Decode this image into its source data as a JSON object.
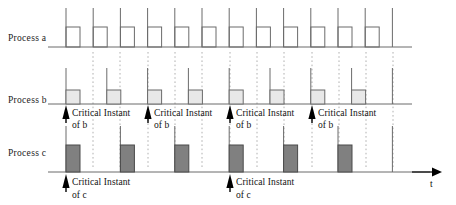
{
  "figure": {
    "time_axis_label": "t",
    "background_color": "#ffffff"
  },
  "rows": [
    {
      "id": "process-a",
      "label": "Process a",
      "label_x": 8,
      "label_y": 41,
      "baseline_y": 47,
      "baseline_x_start": 48,
      "baseline_x_end": 412,
      "pulse_fill": "none",
      "pulse_stroke": "#6b6b6b",
      "pulse_top_y": 27,
      "tick_top_y": 8,
      "start_x": 66,
      "period_px": 27.2,
      "width_px": 14,
      "count": 13,
      "pulse_count": 12
    },
    {
      "id": "process-b",
      "label": "Process b",
      "label_x": 8,
      "label_y": 103,
      "baseline_y": 104,
      "baseline_x_start": 48,
      "baseline_x_end": 412,
      "pulse_fill": "#e8e8e8",
      "pulse_stroke": "#6b6b6b",
      "pulse_top_y": 90,
      "tick_top_y": 68,
      "start_x": 66,
      "period_px": 40.8,
      "width_px": 14,
      "count": 9,
      "pulse_count": 8
    },
    {
      "id": "process-c",
      "label": "Process c",
      "label_x": 8,
      "label_y": 156,
      "baseline_y": 172,
      "baseline_x_start": 48,
      "baseline_x_end": 430,
      "pulse_fill": "#808080",
      "pulse_stroke": "#4a4a4a",
      "pulse_top_y": 145,
      "tick_top_y": 126,
      "start_x": 66,
      "period_px": 54.4,
      "width_px": 14,
      "count": 7,
      "pulse_count": 6
    }
  ],
  "dotted_guides": {
    "color": "#b0b0b0",
    "top_y": 52,
    "bottom_y": 168,
    "x_positions": [
      93,
      120,
      148,
      175,
      202,
      230,
      257,
      284,
      312,
      339,
      366,
      393
    ]
  },
  "annotations_b": [
    {
      "id": "critical-instant-b-1",
      "arrow_x": 66,
      "text_x": 72,
      "line1": "Critical Instant",
      "line2": "of b",
      "line1_y": 116,
      "line2_y": 128
    },
    {
      "id": "critical-instant-b-2",
      "arrow_x": 148,
      "text_x": 154,
      "line1": "Critical Instant",
      "line2": "of b",
      "line1_y": 116,
      "line2_y": 128
    },
    {
      "id": "critical-instant-b-3",
      "arrow_x": 230,
      "text_x": 236,
      "line1": "Critical Instant",
      "line2": "of b",
      "line1_y": 116,
      "line2_y": 128
    },
    {
      "id": "critical-instant-b-4",
      "arrow_x": 312,
      "text_x": 318,
      "line1": "Critical Instant",
      "line2": "of b",
      "line1_y": 116,
      "line2_y": 128
    }
  ],
  "annotations_c": [
    {
      "id": "critical-instant-c-1",
      "arrow_x": 66,
      "text_x": 72,
      "line1": "Critical Instant",
      "line2": "of c",
      "line1_y": 185,
      "line2_y": 198
    },
    {
      "id": "critical-instant-c-2",
      "arrow_x": 230,
      "text_x": 236,
      "line1": "Critical Instant",
      "line2": "of c",
      "line1_y": 185,
      "line2_y": 198
    }
  ],
  "time_arrow": {
    "x_start": 412,
    "x_end": 442,
    "y": 172,
    "label": "t",
    "label_x": 430,
    "label_y": 187
  },
  "colors": {
    "stroke_light": "#6b6b6b",
    "stroke_dark": "#4a4a4a",
    "fill_b": "#e8e8e8",
    "fill_c": "#808080",
    "dotted": "#b0b0b0",
    "text": "#111111",
    "arrow": "#000000"
  },
  "chart_data": {
    "type": "line",
    "xlabel": "t",
    "ylabel": "",
    "grid": false,
    "legend": "none",
    "series": [
      {
        "name": "Process a",
        "period": 1,
        "execution": 0.5,
        "pulse_count": 12,
        "fill": "none",
        "release_times": [
          0,
          1,
          2,
          3,
          4,
          5,
          6,
          7,
          8,
          9,
          10,
          11
        ]
      },
      {
        "name": "Process b",
        "period": 1.5,
        "execution": 0.5,
        "pulse_count": 8,
        "fill": "#e8e8e8",
        "release_times": [
          0,
          1.5,
          3,
          4.5,
          6,
          7.5,
          9,
          10.5
        ]
      },
      {
        "name": "Process c",
        "period": 2,
        "execution": 0.5,
        "pulse_count": 6,
        "fill": "#808080",
        "release_times": [
          0,
          2,
          4,
          6,
          8,
          10
        ]
      }
    ],
    "annotations": [
      {
        "label": "Critical Instant of b",
        "at": 0
      },
      {
        "label": "Critical Instant of b",
        "at": 3
      },
      {
        "label": "Critical Instant of b",
        "at": 6
      },
      {
        "label": "Critical Instant of b",
        "at": 9
      },
      {
        "label": "Critical Instant of c",
        "at": 0
      },
      {
        "label": "Critical Instant of c",
        "at": 6
      }
    ]
  }
}
